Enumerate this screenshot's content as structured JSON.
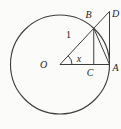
{
  "figure": {
    "labels": {
      "center": "O",
      "point_b": "B",
      "point_d": "D",
      "point_a": "A",
      "point_c": "C",
      "radius_length": "1",
      "angle": "x"
    },
    "colors": {
      "line": "#3c3c3c",
      "text": "#1d1d1d",
      "background": "#fbfbfa"
    }
  }
}
